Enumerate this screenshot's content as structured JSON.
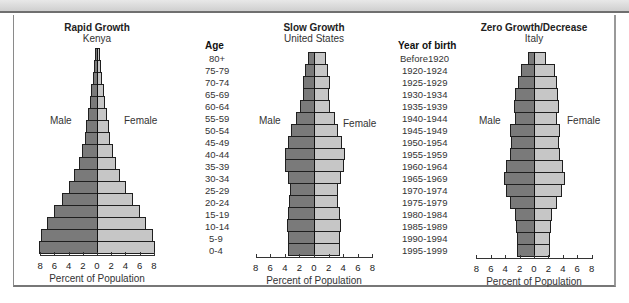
{
  "chart_data": [
    {
      "type": "bar",
      "subtype": "population-pyramid",
      "title": "Rapid Growth",
      "subtitle": "Kenya",
      "left_label": "Male",
      "right_label": "Female",
      "xlabel": "Percent of Population",
      "xticks": [
        "8",
        "6",
        "4",
        "2",
        "0",
        "2",
        "4",
        "6",
        "8"
      ],
      "xlim": [
        -8,
        8
      ],
      "categories": [
        "80+",
        "75-79",
        "70-74",
        "65-69",
        "60-64",
        "55-59",
        "50-54",
        "45-49",
        "40-44",
        "35-39",
        "30-34",
        "25-29",
        "20-24",
        "15-19",
        "10-14",
        "5-9",
        "0-4"
      ],
      "series": [
        {
          "name": "Male",
          "values": [
            0.3,
            0.4,
            0.6,
            0.8,
            1.0,
            1.3,
            1.5,
            1.7,
            2.1,
            2.6,
            3.2,
            4.0,
            5.0,
            6.1,
            7.0,
            7.9,
            8.1
          ]
        },
        {
          "name": "Female",
          "values": [
            0.3,
            0.4,
            0.6,
            0.8,
            1.0,
            1.3,
            1.5,
            1.7,
            2.1,
            2.6,
            3.1,
            3.9,
            4.9,
            5.9,
            6.8,
            7.8,
            8.0
          ]
        }
      ]
    },
    {
      "type": "bar",
      "subtype": "population-pyramid",
      "title": "Slow Growth",
      "subtitle": "United States",
      "left_label": "Male",
      "right_label": "Female",
      "xlabel": "Percent of Population",
      "xticks": [
        "8",
        "6",
        "4",
        "2",
        "0",
        "2",
        "4",
        "6",
        "8"
      ],
      "xlim": [
        -8,
        8
      ],
      "categories": [
        "80+",
        "75-79",
        "70-74",
        "65-69",
        "60-64",
        "55-59",
        "50-54",
        "45-49",
        "40-44",
        "35-39",
        "30-34",
        "25-29",
        "20-24",
        "15-19",
        "10-14",
        "5-9",
        "0-4"
      ],
      "series": [
        {
          "name": "Male",
          "values": [
            0.8,
            1.2,
            1.5,
            1.5,
            1.9,
            2.5,
            3.1,
            3.6,
            4.0,
            4.0,
            3.5,
            3.3,
            3.4,
            3.6,
            3.7,
            3.6,
            3.6
          ]
        },
        {
          "name": "Female",
          "values": [
            1.5,
            1.8,
            2.0,
            1.9,
            2.1,
            2.7,
            3.2,
            3.7,
            4.1,
            4.0,
            3.5,
            3.2,
            3.2,
            3.4,
            3.5,
            3.4,
            3.4
          ]
        }
      ]
    },
    {
      "type": "bar",
      "subtype": "population-pyramid",
      "title": "Zero Growth/Decrease",
      "subtitle": "Italy",
      "left_label": "Male",
      "right_label": "Female",
      "xlabel": "Percent of Population",
      "xticks": [
        "8",
        "6",
        "4",
        "2",
        "0",
        "2",
        "4",
        "6",
        "8"
      ],
      "xlim": [
        -8,
        8
      ],
      "categories": [
        "Before1920",
        "1920-1924",
        "1925-1929",
        "1930-1934",
        "1935-1939",
        "1940-1944",
        "1945-1949",
        "1950-1954",
        "1955-1959",
        "1960-1964",
        "1965-1969",
        "1970-1974",
        "1975-1979",
        "1980-1984",
        "1985-1989",
        "1990-1994",
        "1995-1999"
      ],
      "series": [
        {
          "name": "Male",
          "values": [
            0.9,
            1.8,
            2.2,
            2.6,
            2.8,
            2.7,
            3.3,
            3.2,
            3.4,
            3.9,
            4.2,
            3.9,
            3.3,
            2.7,
            2.5,
            2.4,
            2.4
          ]
        },
        {
          "name": "Female",
          "values": [
            1.5,
            2.8,
            3.0,
            3.2,
            3.3,
            3.1,
            3.5,
            3.4,
            3.5,
            3.9,
            4.2,
            3.8,
            3.1,
            2.4,
            2.2,
            2.1,
            2.1
          ]
        }
      ]
    }
  ],
  "age_column": {
    "header": "Age",
    "labels": [
      "80+",
      "75-79",
      "70-74",
      "65-69",
      "60-64",
      "55-59",
      "50-54",
      "45-49",
      "40-44",
      "35-39",
      "30-34",
      "25-29",
      "20-24",
      "15-19",
      "10-14",
      "5-9",
      "0-4"
    ]
  },
  "year_column": {
    "header": "Year of birth",
    "labels": [
      "Before1920",
      "1920-1924",
      "1925-1929",
      "1930-1934",
      "1935-1939",
      "1940-1944",
      "1945-1949",
      "1950-1954",
      "1955-1959",
      "1960-1964",
      "1965-1969",
      "1970-1974",
      "1975-1979",
      "1980-1984",
      "1985-1989",
      "1990-1994",
      "1995-1999"
    ]
  },
  "colors": {
    "male": "#7a7a7a",
    "female": "#c6c6c6",
    "outline": "#1f1f1f"
  }
}
